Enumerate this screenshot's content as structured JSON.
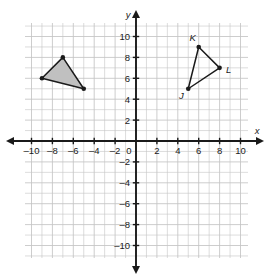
{
  "figure": {
    "background_color": "#ffffff",
    "grid_color": "#c4c4c4",
    "axis_color": "#1a1a1a",
    "shape_stroke_color": "#1a1a1a",
    "shape_fill_color": "#c0c0c0",
    "vertex_dot_color": "#1a1a1a"
  },
  "chart_data": {
    "type": "scatter",
    "title": "",
    "xlabel": "x",
    "ylabel": "y",
    "xlim": [
      -10.5,
      10.6
    ],
    "ylim": [
      -11.2,
      11.2
    ],
    "grid": true,
    "grid_step": 1,
    "legend": "none",
    "x_ticks": [
      -10,
      -8,
      -6,
      -4,
      -2,
      0,
      2,
      4,
      6,
      8,
      10
    ],
    "x_tick_labels": [
      "–10",
      "–8",
      "–6",
      "–4",
      "–2",
      "0",
      "2",
      "4",
      "6",
      "8",
      "10"
    ],
    "y_ticks": [
      -10,
      -8,
      -6,
      -4,
      -2,
      2,
      4,
      6,
      8,
      10
    ],
    "y_tick_labels": [
      "–10",
      "–8",
      "–6",
      "–4",
      "–2",
      "2",
      "4",
      "6",
      "8",
      "10"
    ],
    "series": [
      {
        "name": "shaded-triangle",
        "kind": "polygon",
        "filled": true,
        "labeled": false,
        "points": [
          {
            "label": "",
            "x": -9,
            "y": 6
          },
          {
            "label": "",
            "x": -7,
            "y": 8
          },
          {
            "label": "",
            "x": -5,
            "y": 5
          }
        ]
      },
      {
        "name": "triangle-jkl",
        "kind": "polygon",
        "filled": false,
        "labeled": true,
        "points": [
          {
            "label": "J",
            "x": 5,
            "y": 5
          },
          {
            "label": "K",
            "x": 6,
            "y": 9
          },
          {
            "label": "L",
            "x": 8,
            "y": 7
          }
        ]
      }
    ]
  },
  "axes": {
    "x_axis_label": "x",
    "y_axis_label": "y",
    "origin_label": "0"
  },
  "vertex_labels": {
    "j": "J",
    "k": "K",
    "l": "L"
  }
}
